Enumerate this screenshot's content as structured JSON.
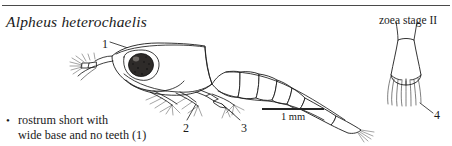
{
  "figure": {
    "species_name": "Alpheus heterochaelis",
    "stage_label": "zoea stage II",
    "caption": {
      "bullet_glyph": "•",
      "line1": "rostrum short with",
      "line2": "wide base and no teeth (1)"
    },
    "scale_bar": {
      "label": "1 mm"
    },
    "callouts": [
      {
        "id": "1",
        "label": "1",
        "target": "rostrum"
      },
      {
        "id": "2",
        "label": "2",
        "target": "maxilliped-setae"
      },
      {
        "id": "3",
        "label": "3",
        "target": "pereiopod"
      },
      {
        "id": "4",
        "label": "4",
        "target": "telson-inset"
      }
    ],
    "colors": {
      "ink": "#1c1c1c",
      "rule": "#4a4a4a",
      "eye": "#2e2b29",
      "background": "#ffffff"
    }
  }
}
